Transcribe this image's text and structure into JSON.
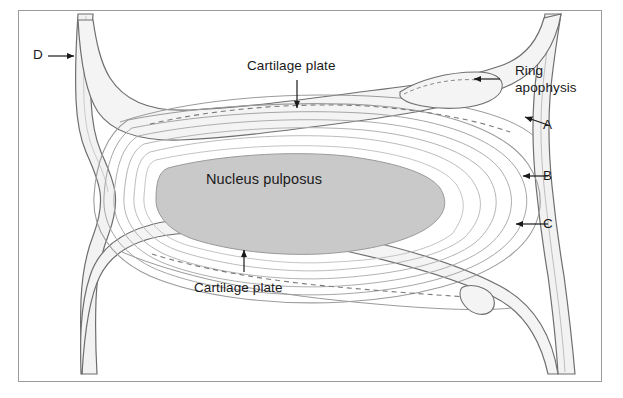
{
  "figure": {
    "type": "anatomical-diagram",
    "background_color": "#ffffff",
    "border_color": "#9a9a9a",
    "nucleus_fill": "#c9c9c9",
    "bone_fill": "#f0f0f0",
    "line_color": "#6e6e6e"
  },
  "labels": {
    "cartilage_plate_top": "Cartilage plate",
    "cartilage_plate_bottom": "Cartilage plate",
    "nucleus_pulposus": "Nucleus pulposus",
    "ring_apophysis_line1": "Ring",
    "ring_apophysis_line2": "apophysis",
    "marker_a": "A",
    "marker_b": "B",
    "marker_c": "C",
    "marker_d": "D"
  }
}
